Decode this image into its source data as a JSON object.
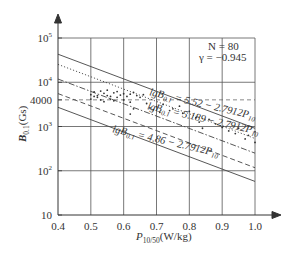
{
  "chart_data": {
    "type": "scatter",
    "title": "",
    "xlabel": "P10/50(W/kg)",
    "ylabel": "B0.1(Gs)",
    "xlim": [
      0.4,
      1.0
    ],
    "ylim_log10": [
      1,
      5
    ],
    "x_ticks": [
      "0.4",
      "0.5",
      "0.6",
      "0.7",
      "0.8",
      "0.9",
      "1.0"
    ],
    "y_ticks": [
      {
        "label": "10",
        "exp": "",
        "log": 1
      },
      {
        "label": "10",
        "exp": "2",
        "log": 2
      },
      {
        "label": "10",
        "exp": "3",
        "log": 3
      },
      {
        "label": "4000",
        "exp": "",
        "log": 3.602
      },
      {
        "label": "10",
        "exp": "4",
        "log": 4
      },
      {
        "label": "10",
        "exp": "5",
        "log": 5
      }
    ],
    "grid": true,
    "annotations": {
      "n": "N = 80",
      "gamma": "γ = −0.945"
    },
    "series": [
      {
        "name": "lgB0.1 = 5.52 − 2.7912P10",
        "style": "dotted",
        "intercept": 5.52,
        "slope": -2.7912
      },
      {
        "name": "lgB0.1 = 5.189 − 2.7912P10",
        "style": "dashdot",
        "intercept": 5.189,
        "slope": -2.7912
      },
      {
        "name": "lgB0.1 = 4.86 − 2.7912P10",
        "style": "dashed",
        "intercept": 4.86,
        "slope": -2.7912
      },
      {
        "name": "upper bound",
        "style": "solid",
        "intercept": 5.75,
        "slope": -2.7912
      },
      {
        "name": "lower bound",
        "style": "solid",
        "intercept": 4.55,
        "slope": -2.7912
      }
    ],
    "equations": [
      {
        "prefix": "lgB",
        "sub": "0.1",
        "rest": " = 5.52 − 2.7912P",
        "sub2": "10"
      },
      {
        "prefix": "lgB",
        "sub": "0.1",
        "rest": " = 5.189 − 2.7912P",
        "sub2": "10"
      },
      {
        "prefix": "lgB",
        "sub": "0.1",
        "rest": " = 4.86 − 2.7912P",
        "sub2": "10"
      }
    ],
    "points": [
      [
        0.5,
        3.72
      ],
      [
        0.51,
        3.78
      ],
      [
        0.52,
        3.7
      ],
      [
        0.53,
        3.8
      ],
      [
        0.54,
        3.75
      ],
      [
        0.55,
        3.82
      ],
      [
        0.56,
        3.68
      ],
      [
        0.57,
        3.76
      ],
      [
        0.58,
        3.79
      ],
      [
        0.59,
        3.71
      ],
      [
        0.6,
        3.74
      ],
      [
        0.52,
        3.66
      ],
      [
        0.55,
        3.7
      ],
      [
        0.58,
        3.66
      ],
      [
        0.53,
        3.6
      ],
      [
        0.56,
        3.62
      ],
      [
        0.61,
        3.68
      ],
      [
        0.62,
        3.73
      ],
      [
        0.63,
        3.77
      ],
      [
        0.64,
        3.7
      ],
      [
        0.65,
        3.66
      ],
      [
        0.66,
        3.72
      ],
      [
        0.54,
        3.56
      ],
      [
        0.57,
        3.58
      ],
      [
        0.6,
        3.6
      ],
      [
        0.62,
        3.55
      ],
      [
        0.5,
        3.62
      ],
      [
        0.51,
        3.68
      ],
      [
        0.68,
        3.42
      ],
      [
        0.69,
        3.38
      ],
      [
        0.7,
        3.45
      ],
      [
        0.71,
        3.32
      ],
      [
        0.72,
        3.5
      ],
      [
        0.74,
        3.36
      ],
      [
        0.75,
        3.4
      ],
      [
        0.77,
        3.46
      ],
      [
        0.78,
        3.3
      ],
      [
        0.8,
        3.34
      ],
      [
        0.82,
        3.2
      ],
      [
        0.83,
        3.1
      ],
      [
        0.84,
        2.96
      ],
      [
        0.86,
        3.16
      ],
      [
        0.88,
        3.06
      ],
      [
        0.9,
        2.98
      ],
      [
        0.92,
        2.9
      ],
      [
        0.94,
        2.84
      ],
      [
        0.97,
        2.72
      ],
      [
        1.0,
        2.88
      ],
      [
        1.0,
        2.64
      ],
      [
        0.98,
        2.8
      ],
      [
        0.95,
        2.96
      ],
      [
        0.62,
        3.28
      ],
      [
        0.63,
        3.4
      ],
      [
        0.67,
        3.52
      ]
    ]
  }
}
